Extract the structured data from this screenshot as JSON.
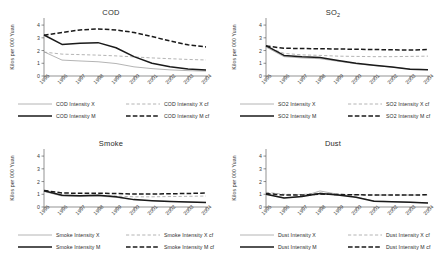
{
  "figure": {
    "ylabel": "Kilos per 000 Yuan",
    "yticks": [
      "0",
      "1",
      "2",
      "3",
      "4"
    ],
    "xticks": [
      "1995",
      "1996",
      "1997",
      "1998",
      "1999",
      "2000",
      "2001",
      "2002",
      "2003",
      "2004"
    ],
    "series_colors": {
      "X": "#9b9b9b",
      "X_cf": "#9b9b9b",
      "M": "#1a1a1a",
      "M_cf": "#1a1a1a"
    }
  },
  "chart_data": [
    {
      "type": "line",
      "title": "COD",
      "title_sub": "",
      "xlabel": "",
      "ylabel": "Kilos per 000 Yuan",
      "ylim": [
        0,
        4.4
      ],
      "yticks": [
        0,
        1,
        2,
        3,
        4
      ],
      "grid": false,
      "legend_position": "below",
      "x": [
        1995,
        1996,
        1997,
        1998,
        1999,
        2000,
        2001,
        2002,
        2003,
        2004
      ],
      "series": [
        {
          "name": "COD Intensity X",
          "style": "thin-solid",
          "color": "#9b9b9b",
          "values": [
            1.9,
            1.25,
            1.18,
            1.12,
            0.98,
            0.72,
            0.58,
            0.48,
            0.42,
            0.38
          ]
        },
        {
          "name": "COD Intensity X cf",
          "style": "thin-dashed",
          "color": "#9b9b9b",
          "values": [
            1.88,
            1.72,
            1.68,
            1.64,
            1.58,
            1.5,
            1.42,
            1.36,
            1.3,
            1.26
          ]
        },
        {
          "name": "COD Intensity M",
          "style": "thick-solid",
          "color": "#1a1a1a",
          "values": [
            3.22,
            2.48,
            2.58,
            2.62,
            2.22,
            1.52,
            1.0,
            0.72,
            0.55,
            0.48
          ]
        },
        {
          "name": "COD Intensity M cf",
          "style": "thick-dashed",
          "color": "#1a1a1a",
          "values": [
            3.2,
            3.42,
            3.62,
            3.7,
            3.62,
            3.42,
            3.1,
            2.75,
            2.45,
            2.28
          ]
        }
      ]
    },
    {
      "type": "line",
      "title": "SO",
      "title_sub": "2",
      "xlabel": "",
      "ylabel": "Kilos per 000 Yuan",
      "ylim": [
        0,
        4.4
      ],
      "yticks": [
        0,
        1,
        2,
        3,
        4
      ],
      "grid": false,
      "legend_position": "below",
      "x": [
        1995,
        1996,
        1997,
        1998,
        1999,
        2000,
        2001,
        2002,
        2003,
        2004
      ],
      "series": [
        {
          "name": "SO2 Intensity X",
          "style": "thin-solid",
          "color": "#9b9b9b",
          "values": [
            2.28,
            1.52,
            1.42,
            1.36,
            1.16,
            0.96,
            0.82,
            0.7,
            0.56,
            0.5
          ]
        },
        {
          "name": "SO2 Intensity X cf",
          "style": "thin-dashed",
          "color": "#9b9b9b",
          "values": [
            2.3,
            1.78,
            1.66,
            1.62,
            1.56,
            1.54,
            1.52,
            1.52,
            1.54,
            1.56
          ]
        },
        {
          "name": "SO2 Intensity M",
          "style": "thick-solid",
          "color": "#1a1a1a",
          "values": [
            2.38,
            1.62,
            1.52,
            1.46,
            1.22,
            1.0,
            0.84,
            0.7,
            0.54,
            0.5
          ]
        },
        {
          "name": "SO2 Intensity M cf",
          "style": "thick-dashed",
          "color": "#1a1a1a",
          "values": [
            2.36,
            2.18,
            2.16,
            2.14,
            2.12,
            2.1,
            2.08,
            2.06,
            2.04,
            2.08
          ]
        }
      ]
    },
    {
      "type": "line",
      "title": "Smoke",
      "title_sub": "",
      "xlabel": "",
      "ylabel": "Kilos per 000 Yuan",
      "ylim": [
        0,
        4.4
      ],
      "yticks": [
        0,
        1,
        2,
        3,
        4
      ],
      "grid": false,
      "legend_position": "below",
      "x": [
        1995,
        1996,
        1997,
        1998,
        1999,
        2000,
        2001,
        2002,
        2003,
        2004
      ],
      "series": [
        {
          "name": "Smoke Intensity X",
          "style": "thin-solid",
          "color": "#9b9b9b",
          "values": [
            1.22,
            0.86,
            0.82,
            0.86,
            0.76,
            0.56,
            0.5,
            0.44,
            0.4,
            0.36
          ]
        },
        {
          "name": "Smoke Intensity X cf",
          "style": "thin-dashed",
          "color": "#9b9b9b",
          "values": [
            1.24,
            0.94,
            0.9,
            0.92,
            0.86,
            0.8,
            0.8,
            0.82,
            0.84,
            0.86
          ]
        },
        {
          "name": "Smoke Intensity M",
          "style": "thick-solid",
          "color": "#1a1a1a",
          "values": [
            1.28,
            0.92,
            0.88,
            0.92,
            0.8,
            0.58,
            0.5,
            0.44,
            0.4,
            0.36
          ]
        },
        {
          "name": "Smoke Intensity M cf",
          "style": "thick-dashed",
          "color": "#1a1a1a",
          "values": [
            1.3,
            1.1,
            1.08,
            1.08,
            1.06,
            1.02,
            1.02,
            1.04,
            1.06,
            1.1
          ]
        }
      ]
    },
    {
      "type": "line",
      "title": "Dust",
      "title_sub": "",
      "xlabel": "",
      "ylabel": "Kilos per 000 Yuan",
      "ylim": [
        0,
        4.4
      ],
      "yticks": [
        0,
        1,
        2,
        3,
        4
      ],
      "grid": false,
      "legend_position": "below",
      "x": [
        1995,
        1996,
        1997,
        1998,
        1999,
        2000,
        2001,
        2002,
        2003,
        2004
      ],
      "series": [
        {
          "name": "Dust Intensity X",
          "style": "thin-solid",
          "color": "#9b9b9b",
          "values": [
            1.02,
            0.72,
            0.82,
            1.26,
            1.0,
            0.78,
            0.48,
            0.42,
            0.38,
            0.32
          ]
        },
        {
          "name": "Dust Intensity X cf",
          "style": "thin-dashed",
          "color": "#9b9b9b",
          "values": [
            1.16,
            1.0,
            0.98,
            1.1,
            1.0,
            0.96,
            0.94,
            0.94,
            0.94,
            0.94
          ]
        },
        {
          "name": "Dust Intensity M",
          "style": "thick-solid",
          "color": "#1a1a1a",
          "values": [
            1.0,
            0.7,
            0.82,
            1.06,
            0.94,
            0.76,
            0.46,
            0.42,
            0.38,
            0.32
          ]
        },
        {
          "name": "Dust Intensity M cf",
          "style": "thick-dashed",
          "color": "#1a1a1a",
          "values": [
            1.06,
            0.94,
            0.94,
            1.02,
            0.98,
            0.96,
            0.94,
            0.94,
            0.94,
            0.96
          ]
        }
      ]
    }
  ],
  "panels": [
    {
      "id": "cod",
      "title": "COD",
      "legend": [
        {
          "label": "COD Intensity X",
          "style": "thin-solid"
        },
        {
          "label": "COD Intensity X cf",
          "style": "thin-dashed"
        },
        {
          "label": "COD Intensity M",
          "style": "thick-solid"
        },
        {
          "label": "COD Intensity M cf",
          "style": "thick-dashed"
        }
      ]
    },
    {
      "id": "so2",
      "title": "SO",
      "title_sub": "2",
      "legend": [
        {
          "label": "SO2 Intensity X",
          "style": "thin-solid"
        },
        {
          "label": "SO2 Intensity X cf",
          "style": "thin-dashed"
        },
        {
          "label": "SO2 Intensity M",
          "style": "thick-solid"
        },
        {
          "label": "SO2 Intensity M cf",
          "style": "thick-dashed"
        }
      ]
    },
    {
      "id": "smoke",
      "title": "Smoke",
      "legend": [
        {
          "label": "Smoke Intensity X",
          "style": "thin-solid"
        },
        {
          "label": "Smoke Intensity X cf",
          "style": "thin-dashed"
        },
        {
          "label": "Smoke Intensity M",
          "style": "thick-solid"
        },
        {
          "label": "Smoke Intensity M cf",
          "style": "thick-dashed"
        }
      ]
    },
    {
      "id": "dust",
      "title": "Dust",
      "legend": [
        {
          "label": "Dust Intensity X",
          "style": "thin-solid"
        },
        {
          "label": "Dust Intensity X cf",
          "style": "thin-dashed"
        },
        {
          "label": "Dust Intensity M",
          "style": "thick-solid"
        },
        {
          "label": "Dust Intensity M cf",
          "style": "thick-dashed"
        }
      ]
    }
  ]
}
